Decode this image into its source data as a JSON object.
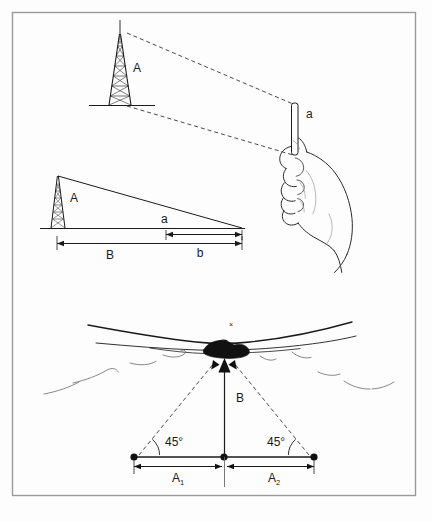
{
  "figure": {
    "background_color": "#fdfdfd",
    "border_color": "#9a9a9a",
    "ink_color": "#1a1a1a",
    "dash_color": "#4a4a4a"
  },
  "panels": {
    "top": {
      "name": "sighting-panel",
      "tower_label": "A",
      "stick_label": "a",
      "icons": [
        "lattice-tower-icon",
        "hand-holding-stick-icon",
        "sight-line-dashed"
      ]
    },
    "middle": {
      "name": "similar-triangles-panel",
      "tower_label": "A",
      "hypotenuse_label": "a",
      "baseline_label": "B",
      "short_dim_label": "b",
      "icons": [
        "lattice-tower-icon",
        "dimension-arrow-icon"
      ]
    },
    "bottom": {
      "name": "triangulation-panel",
      "angle_left": "45°",
      "angle_right": "45°",
      "height_label": "B",
      "dim_left_label": "A",
      "dim_left_sub": "1",
      "dim_right_label": "A",
      "dim_right_sub": "2",
      "target_mark": "×",
      "icons": [
        "water-surface-icon",
        "target-blob-icon",
        "bearing-arrow-icon",
        "station-dot-icon"
      ]
    }
  }
}
